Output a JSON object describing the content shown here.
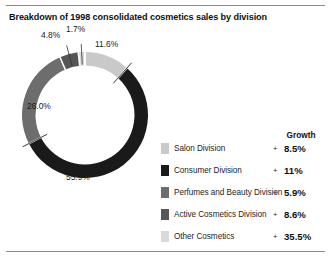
{
  "title": "Breakdown of 1998 consolidated cosmetics sales by division",
  "legend_header": "Growth",
  "growth_sign": "+",
  "colors": {
    "salon": "#c9c9c9",
    "consumer": "#1a1a1a",
    "perfumes": "#6d6d6d",
    "active": "#565656",
    "other": "#d9d9d9",
    "separator": "#ffffff",
    "rule": "#8a8a8a",
    "text": "#1c1c1c"
  },
  "chart_data": {
    "type": "pie",
    "title": "Breakdown of 1998 consolidated cosmetics sales by division",
    "subtitle": "",
    "xlabel": "",
    "ylabel": "",
    "grid": false,
    "legend_position": "right",
    "donut": true,
    "units": "percent of consolidated cosmetics sales",
    "start_angle_deg": 0,
    "direction": "clockwise",
    "labels": [
      "Salon Division",
      "Consumer Division",
      "Perfumes and Beauty Division",
      "Active Cosmetics Division",
      "Other Cosmetics"
    ],
    "values": [
      11.6,
      55.9,
      26.0,
      4.8,
      1.7
    ],
    "value_labels": [
      "11.6%",
      "55.9%",
      "26.0%",
      "4.8%",
      "1.7%"
    ],
    "colors": [
      "#c9c9c9",
      "#1a1a1a",
      "#6d6d6d",
      "#565656",
      "#d9d9d9"
    ],
    "growth": [
      8.5,
      11,
      5.9,
      8.6,
      35.5
    ],
    "growth_labels": [
      "8.5%",
      "11%",
      "5.9%",
      "8.6%",
      "35.5%"
    ],
    "series": [
      {
        "name": "Share of 1998 consolidated cosmetics sales",
        "values": [
          11.6,
          55.9,
          26.0,
          4.8,
          1.7
        ]
      },
      {
        "name": "Growth",
        "values": [
          8.5,
          11,
          5.9,
          8.6,
          35.5
        ]
      }
    ]
  },
  "legend": [
    {
      "name": "Salon Division",
      "growth": "8.5%",
      "sign": "+",
      "swatch": "#c9c9c9"
    },
    {
      "name": "Consumer Division",
      "growth": "11%",
      "sign": "+",
      "swatch": "#1a1a1a"
    },
    {
      "name": "Perfumes and Beauty Division",
      "growth": "5.9%",
      "sign": "+",
      "swatch": "#6d6d6d"
    },
    {
      "name": "Active Cosmetics Division",
      "growth": "8.6%",
      "sign": "+",
      "swatch": "#565656"
    },
    {
      "name": "Other Cosmetics",
      "growth": "35.5%",
      "sign": "+",
      "swatch": "#d9d9d9"
    }
  ]
}
